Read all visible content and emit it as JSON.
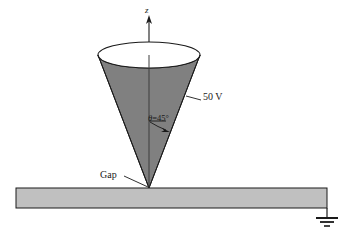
{
  "figure": {
    "type": "electrostatics-diagram",
    "colors": {
      "cone_fill": "#808080",
      "cone_top_fill": "#ffffff",
      "plate_fill": "#c0c0c0",
      "stroke": "#1a1a1a",
      "background": "#ffffff"
    },
    "labels": {
      "axis_z": "z",
      "voltage": "50 V",
      "angle_symbol": "θ",
      "angle_equals": "=",
      "angle_value": "45°",
      "gap": "Gap"
    },
    "geometry": {
      "axis_x": 149,
      "axis_top_y": 18,
      "apex_x": 149,
      "apex_y": 188,
      "ellipse_center_x": 149,
      "ellipse_center_y": 55,
      "ellipse_rx": 51,
      "ellipse_ry": 13,
      "plate_left_x": 16,
      "plate_right_x": 327,
      "plate_top_y": 188,
      "plate_bottom_y": 208,
      "ground_stem_bottom_y": 218
    },
    "icons": {
      "ground": "ground-symbol",
      "axis_arrow": "arrow-up-icon",
      "angle_arrow": "arrow-pointer-icon"
    }
  }
}
